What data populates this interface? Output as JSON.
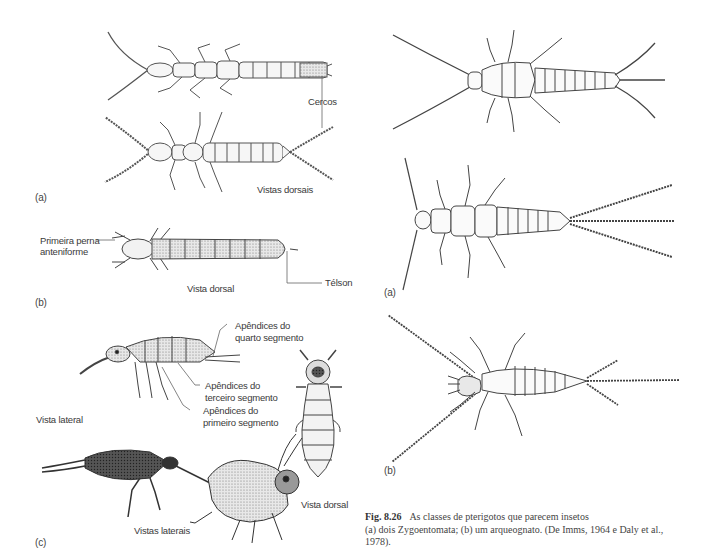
{
  "figure": {
    "number": "Fig. 8.26",
    "title": "As classes de pterigotos que parecem insetos",
    "caption_line2": "(a) dois Zygoentomata; (b) um arqueognato. (De Imms, 1964 e Daly et al.,",
    "caption_line3": "1978)."
  },
  "left_column": {
    "panel_a": {
      "letter": "(a)",
      "labels": {
        "cercos": "Cercos",
        "vistas_dorsais": "Vistas dorsais"
      }
    },
    "panel_b": {
      "letter": "(b)",
      "labels": {
        "primeira_perna_1": "Primeira perna",
        "primeira_perna_2": "anteniforme",
        "telson": "Télson",
        "vista_dorsal": "Vista dorsal"
      }
    },
    "panel_c": {
      "letter": "(c)",
      "labels": {
        "quarto_1": "Apêndices do",
        "quarto_2": "quarto segmento",
        "terceiro_1": "Apêndices do",
        "terceiro_2": "terceiro segmento",
        "primeiro_1": "Apêndices do",
        "primeiro_2": "primeiro segmento",
        "vista_lateral": "Vista lateral",
        "vistas_laterais": "Vistas laterais",
        "vista_dorsal": "Vista dorsal"
      }
    }
  },
  "right_column": {
    "panel_a": {
      "letter": "(a)"
    },
    "panel_b": {
      "letter": "(b)"
    }
  }
}
